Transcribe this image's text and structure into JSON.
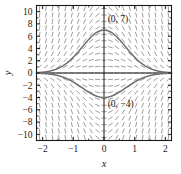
{
  "chart_data": {
    "type": "line",
    "title": "",
    "subtitle": "",
    "xlabel": "x",
    "ylabel": "y",
    "xlim": [
      -2.2,
      2.2
    ],
    "ylim": [
      -11,
      11
    ],
    "xticks": [
      -2,
      -1,
      0,
      1,
      2
    ],
    "xticklabels": [
      "−2",
      "−1",
      "0",
      "1",
      "2"
    ],
    "yticks": [
      -10,
      -8,
      -6,
      -4,
      -2,
      0,
      2,
      4,
      6,
      8,
      10
    ],
    "yticklabels": [
      "−10",
      "−8",
      "−6",
      "−4",
      "−2",
      "0",
      "2",
      "4",
      "6",
      "8",
      "10"
    ],
    "grid": false,
    "legend": null,
    "frame": true,
    "minor_ticks": true,
    "field": {
      "kind": "slope-field",
      "description": "direction field of dy/dx = -2xy",
      "equation": "dy/dx = -2xy",
      "nx": 21,
      "ny": 21,
      "x_range": [
        -2.1,
        2.1
      ],
      "y_range": [
        -10.5,
        10.5
      ],
      "color": "#8c8c8c"
    },
    "series": [
      {
        "name": "solution through (0, 7)",
        "initial_condition": {
          "x": 0,
          "y": 7
        },
        "form": "y = 7*exp(-x^2)*scale",
        "color": "#6e6e6e",
        "peak": 7
      },
      {
        "name": "solution through (0, -4)",
        "initial_condition": {
          "x": 0,
          "y": -4
        },
        "form": "y = -4*exp(-x^2)*scale",
        "color": "#6e6e6e",
        "peak": -4
      }
    ],
    "annotations": [
      {
        "text": "(0, 7)",
        "x": 0.12,
        "y": 8.3,
        "anchor": "start"
      },
      {
        "text": "(0, −4)",
        "x": 0.12,
        "y": -5.6,
        "anchor": "start"
      }
    ]
  },
  "labels": {
    "x_axis_title": "x",
    "y_axis_title": "y",
    "annotation_top": "(0, 7)",
    "annotation_bottom": "(0, −4)"
  },
  "colors": {
    "axis": "#1a1a1a",
    "frame": "#1a1a1a",
    "field": "#8c8c8c",
    "curve": "#6e6e6e",
    "background": "#ffffff",
    "text": "#1a1a1a"
  }
}
